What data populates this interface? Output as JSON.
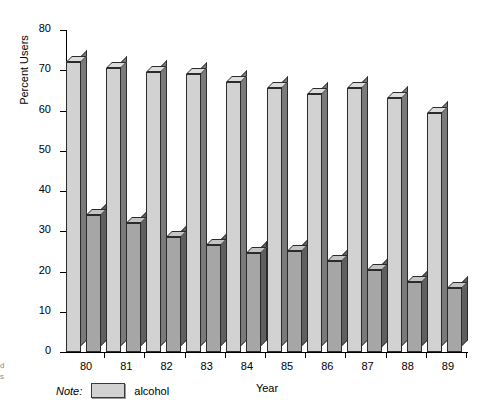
{
  "margin_glyphs": [
    "d",
    "s"
  ],
  "legend": {
    "note_label": "Note:",
    "series_label": "alcohol"
  },
  "chart_data": {
    "type": "bar",
    "title": "",
    "xlabel": "Year",
    "ylabel": "Percent Users",
    "categories": [
      "80",
      "81",
      "82",
      "83",
      "84",
      "85",
      "86",
      "87",
      "88",
      "89"
    ],
    "ylim": [
      0,
      80
    ],
    "yticks": [
      0,
      10,
      20,
      30,
      40,
      50,
      60,
      70,
      80
    ],
    "grid": false,
    "legend_position": "below-axes-left",
    "series": [
      {
        "name": "alcohol",
        "color": "#d2d2d2",
        "values": [
          72,
          70.5,
          69.5,
          69,
          67,
          65.5,
          64,
          65.5,
          63,
          59.5
        ]
      },
      {
        "name": "",
        "color": "#a6a6a6",
        "values": [
          34,
          32,
          28.5,
          26.5,
          24.5,
          25,
          22.5,
          20.5,
          17.5,
          16
        ]
      }
    ]
  }
}
